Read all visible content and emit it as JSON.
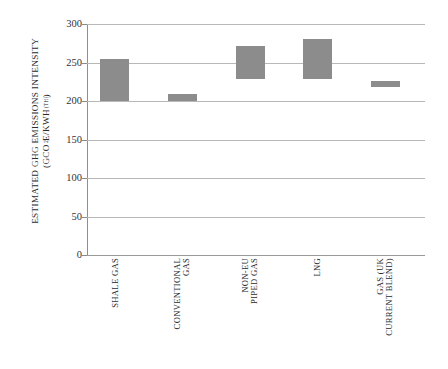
{
  "chart_data": {
    "type": "bar",
    "bar_style": "floating-range",
    "title": "",
    "xlabel": "",
    "ylabel_line1": "ESTIMATED GHG EMISSIONS INTENSITY",
    "ylabel_line2_prefix": "(GCO",
    "ylabel_line2_sub": "2",
    "ylabel_line2_mid": "E/KWH",
    "ylabel_line2_subscript": "(TH)",
    "ylabel_line2_suffix": ")",
    "categories": [
      "SHALE GAS",
      "CONVENTIONAL GAS",
      "NON-EU PIPED GAS",
      "LNG",
      "GAS (UK CURRENT BLEND)"
    ],
    "category_lines": [
      [
        "SHALE GAS"
      ],
      [
        "CONVENTIONAL",
        "GAS"
      ],
      [
        "NON-EU",
        "PIPED GAS"
      ],
      [
        "LNG"
      ],
      [
        "GAS (UK",
        "CURRENT BLEND)"
      ]
    ],
    "low": [
      200,
      200,
      228,
      228,
      218
    ],
    "high": [
      255,
      209,
      272,
      280,
      226
    ],
    "ylim": [
      0,
      300
    ],
    "yticks": [
      0,
      50,
      100,
      150,
      200,
      250,
      300
    ],
    "ytick_labels": [
      "0",
      "50",
      "100",
      "150",
      "200",
      "250",
      "300"
    ],
    "grid": true,
    "grid_axis": "y",
    "legend": "none",
    "bar_color": "#8c8c8c",
    "grid_color": "#b8b8b8",
    "axis_color": "#8f8f8f",
    "background": "#ffffff"
  }
}
